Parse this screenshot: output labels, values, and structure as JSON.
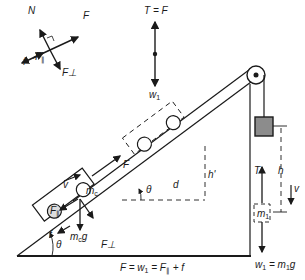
{
  "free_body_car": {
    "N": "N",
    "F": "F",
    "f": "f",
    "F_par": "F",
    "F_par_sub": "∥",
    "F_perp": "F⊥"
  },
  "free_body_mass": {
    "tension": "T = F",
    "weight": "w",
    "weight_sub": "1"
  },
  "incline": {
    "v": "v",
    "mc": "m",
    "mc_sub": "c",
    "mcg": "m",
    "mcg_sub": "c",
    "mcg_g": "g",
    "F_par": "F",
    "F_par_sub": "∥",
    "f": "f",
    "theta1": "θ",
    "theta2": "θ",
    "F_perp": "F⊥",
    "F": "F",
    "d": "d",
    "h_prime": "h'"
  },
  "hanging": {
    "T": "T",
    "h": "h",
    "v": "v",
    "m1": "m",
    "m1_sub": "1",
    "w1_eq": "w",
    "w1_eq_sub": "1",
    "w1_eq_rest": " = m",
    "w1_eq_rest_sub": "1",
    "w1_eq_g": "g"
  },
  "equation": {
    "prefix": "F = w",
    "sub1": "1",
    "mid": " = F",
    "sub2": "∥",
    "suffix": " + f"
  }
}
